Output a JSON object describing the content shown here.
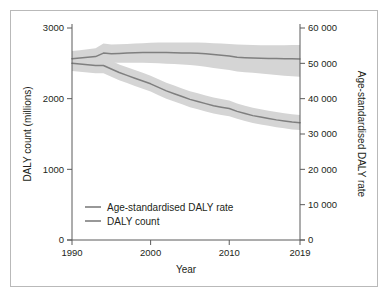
{
  "figure": {
    "background": "#ffffff",
    "frame_color": "#b9b9b9",
    "axis_color": "#5b5b5b"
  },
  "chart_data": {
    "type": "line",
    "title": "",
    "xlabel": "Year",
    "ylabel": "DALY count (millions)",
    "y2label": "Age-standardised DALY rate",
    "grid": false,
    "legend_position": "inside-lower-left",
    "xlim": [
      1990,
      2019
    ],
    "xticks": [
      1990,
      2000,
      2010,
      2019
    ],
    "xticklabels": [
      "1990",
      "2000",
      "2010",
      "2019"
    ],
    "ylim": [
      0,
      3000
    ],
    "yticks": [
      0,
      1000,
      2000,
      3000
    ],
    "yticklabels": [
      "0",
      "1000",
      "2000",
      "3000"
    ],
    "y2lim": [
      0,
      60000
    ],
    "y2ticks": [
      0,
      10000,
      20000,
      30000,
      40000,
      50000,
      60000
    ],
    "y2ticklabels": [
      "0",
      "10 000",
      "20 000",
      "30 000",
      "40 000",
      "50 000",
      "60 000"
    ],
    "x": [
      1990,
      1991,
      1992,
      1993,
      1994,
      1995,
      1996,
      1997,
      1998,
      1999,
      2000,
      2001,
      2002,
      2003,
      2004,
      2005,
      2006,
      2007,
      2008,
      2009,
      2010,
      2011,
      2012,
      2013,
      2014,
      2015,
      2016,
      2017,
      2018,
      2019
    ],
    "series": [
      {
        "name": "Age-standardised DALY rate",
        "axis": "right",
        "color": "#7f7f7f",
        "band_color": "#d5d5d5",
        "values": [
          51300,
          51500,
          51700,
          51900,
          52900,
          52700,
          52800,
          52900,
          53000,
          53050,
          53100,
          53100,
          53050,
          53000,
          52950,
          52900,
          52850,
          52700,
          52500,
          52300,
          52100,
          51700,
          51600,
          51500,
          51450,
          51400,
          51350,
          51300,
          51280,
          51250
        ],
        "band_lower": [
          49200,
          49300,
          49400,
          49500,
          50300,
          50200,
          50200,
          50200,
          50200,
          50150,
          50100,
          50000,
          49900,
          49800,
          49700,
          49500,
          49300,
          49000,
          48700,
          48400,
          48100,
          47700,
          47500,
          47300,
          47100,
          46900,
          46700,
          46500,
          46350,
          46200
        ],
        "band_upper": [
          53500,
          53700,
          54000,
          54300,
          55600,
          55300,
          55400,
          55500,
          55600,
          55700,
          55800,
          55900,
          55900,
          55900,
          55900,
          55900,
          55900,
          55800,
          55700,
          55600,
          55500,
          55300,
          55250,
          55200,
          55150,
          55150,
          55150,
          55150,
          55160,
          55180
        ]
      },
      {
        "name": "DALY count",
        "axis": "left",
        "color": "#7f7f7f",
        "band_color": "#d5d5d5",
        "values": [
          2500,
          2490,
          2480,
          2470,
          2470,
          2420,
          2370,
          2330,
          2290,
          2250,
          2210,
          2160,
          2110,
          2070,
          2030,
          1990,
          1960,
          1930,
          1900,
          1880,
          1860,
          1820,
          1790,
          1760,
          1740,
          1720,
          1700,
          1685,
          1670,
          1660
        ],
        "band_lower": [
          2390,
          2380,
          2370,
          2360,
          2360,
          2310,
          2260,
          2220,
          2180,
          2140,
          2100,
          2050,
          2000,
          1960,
          1920,
          1880,
          1850,
          1820,
          1790,
          1770,
          1750,
          1715,
          1685,
          1655,
          1635,
          1615,
          1595,
          1580,
          1565,
          1555
        ],
        "band_upper": [
          2610,
          2600,
          2595,
          2590,
          2590,
          2535,
          2485,
          2445,
          2405,
          2365,
          2325,
          2275,
          2225,
          2185,
          2145,
          2105,
          2075,
          2045,
          2015,
          1995,
          1975,
          1930,
          1900,
          1870,
          1850,
          1830,
          1810,
          1795,
          1780,
          1770
        ]
      }
    ],
    "legend": [
      {
        "label": "Age-standardised DALY rate",
        "color": "#7f7f7f"
      },
      {
        "label": "DALY count",
        "color": "#7f7f7f"
      }
    ]
  }
}
